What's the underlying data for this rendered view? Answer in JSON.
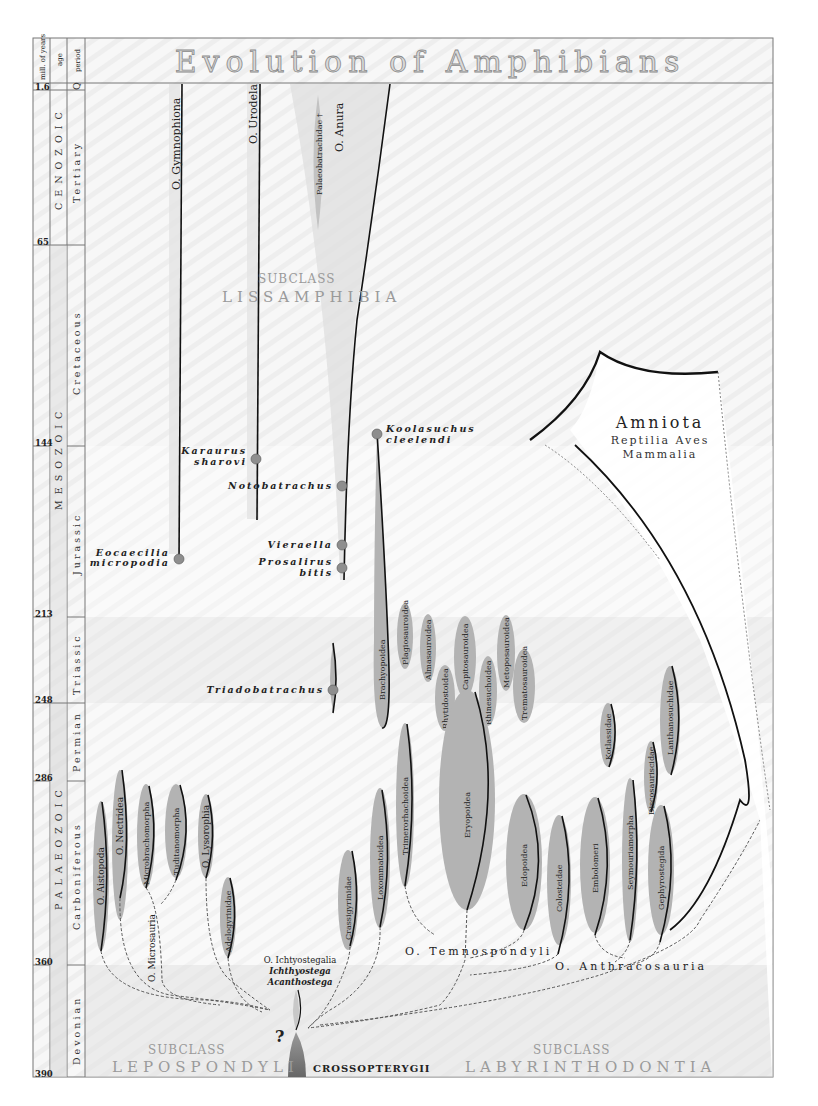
{
  "title": "Evolution of Amphibians",
  "header_columns": {
    "years": "mill. of years",
    "age": "age",
    "period": "period"
  },
  "timescale": {
    "ticks": [
      "1.6",
      "65",
      "144",
      "213",
      "248",
      "286",
      "360",
      "390"
    ],
    "ages": [
      "CENOZOIC",
      "MESOZOIC",
      "PALAEOZOIC"
    ],
    "periods": [
      "Q",
      "Tertiary",
      "Cretaceous",
      "Jurassic",
      "Triassic",
      "Permian",
      "Carboniferous",
      "Devonian"
    ]
  },
  "subclasses": {
    "lissamphibia": {
      "prefix": "SUBCLASS",
      "name": "LISSAMPHIBIA"
    },
    "lepospondyli": {
      "prefix": "SUBCLASS",
      "name": "LEPOSPONDYLI"
    },
    "labyrinthodontia": {
      "prefix": "SUBCLASS",
      "name": "LABYRINTHODONTIA"
    }
  },
  "root": "CROSSOPTERYGII",
  "uncertain_mark": "?",
  "ichthyostegalia": {
    "order": "O. Ichtyostegalia",
    "genera": [
      "Ichthyostega",
      "Acanthostega"
    ]
  },
  "lissamphibia_orders": [
    "O. Gymnophiona",
    "O. Urodela",
    "O. Anura",
    "Palaeobatrachidae †"
  ],
  "fossil_genera": {
    "eocaecilia": [
      "Eocaecilia",
      "micropodia"
    ],
    "karaurus": [
      "Karaurus",
      "sharovi"
    ],
    "notobatrachus": "Notobatrachus",
    "vieraella": "Vieraella",
    "prosalirus": [
      "Prosalirus",
      "bitis"
    ],
    "koolasuchus": [
      "Koolasuchus",
      "cleelendi"
    ],
    "triadobatrachus": "Triadobatrachus"
  },
  "lepospondyli_clades": [
    "O. Aistopoda",
    "O. Nectridea",
    "Microbrachomorpha",
    "Tuditanomorpha",
    "O. Lysorophia",
    "Adelogyrinidae",
    "O. Microsauria"
  ],
  "temnospondyli_clades": [
    "Crassigyrinidae",
    "Loxommatoidea",
    "Trimerorhachoidea",
    "Eryopoidea",
    "Edopoidea",
    "Brachyopoidea",
    "Plagiosauroidea",
    "Almasauroidea",
    "Rhytidostoidea",
    "Capitosauroidea",
    "Rhinesuchoidea",
    "Metoposauroidea",
    "Trematosauroidea"
  ],
  "anthracosauria_clades": [
    "Colosteidae",
    "Embolomeri",
    "Seymouriamorpha",
    "Gephyrostegida",
    "Kotlassidae",
    "Discosauriscidae",
    "Lanthanosuchidae"
  ],
  "group_labels": {
    "temnospondyli": "O. Temnospondyli",
    "anthracosauria": "O. Anthracosauria"
  },
  "amniota": {
    "title": "Amniota",
    "line1": "Reptilia Aves",
    "line2": "Mammalia"
  },
  "colors": {
    "frame": "#777777",
    "lineage_fill": "#b3b3b3",
    "root_fill": "#7a7a7a",
    "band_light": "#f4f4f4",
    "band_dark": "#e4e4e4"
  }
}
